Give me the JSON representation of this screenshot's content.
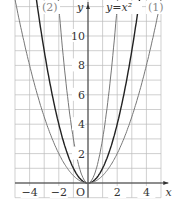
{
  "chart_data": {
    "type": "line",
    "title": "",
    "xlabel": "x",
    "ylabel": "y",
    "xlim": [
      -5,
      5.5
    ],
    "ylim": [
      -1,
      12
    ],
    "grid": true,
    "x_ticks": [
      "-4",
      "-2",
      "2",
      "4"
    ],
    "y_ticks": [
      "2",
      "4",
      "6",
      "8",
      "10"
    ],
    "origin_label": "O",
    "series": [
      {
        "name": "y=x^2",
        "a": 1,
        "color": "#222222"
      },
      {
        "name": "(1)",
        "a": 0.5,
        "color": "#777777"
      },
      {
        "name": "(2)",
        "a": 3,
        "color": "#777777"
      }
    ],
    "annotations": [
      "y=x²",
      "(1)",
      "(2)"
    ]
  }
}
